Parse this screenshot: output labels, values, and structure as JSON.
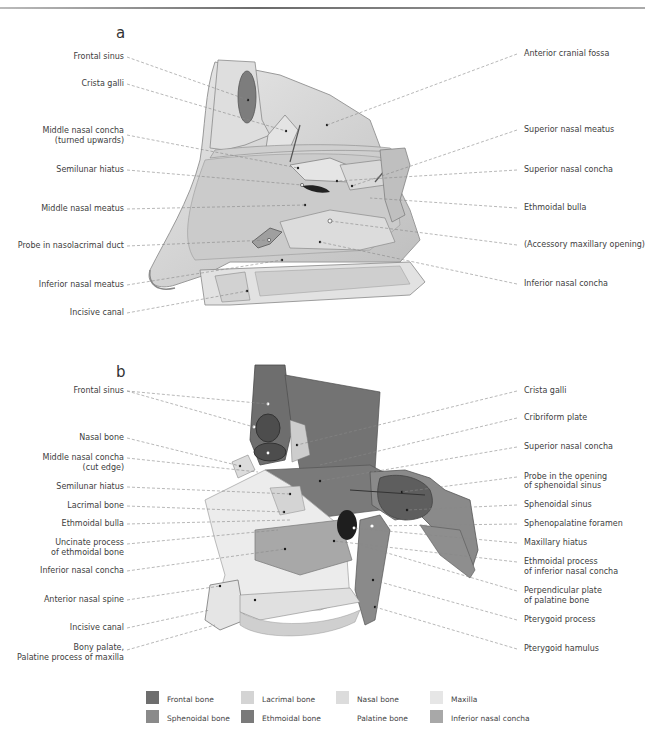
{
  "figure": {
    "panels": [
      {
        "id": "a",
        "letter": "a",
        "left_labels": [
          "Frontal sinus",
          "Crista galli",
          "Middle nasal concha",
          "(turned upwards)",
          "Semilunar hiatus",
          "Middle nasal meatus",
          "Probe in nasolacrimal duct",
          "Inferior nasal meatus",
          "Incisive canal"
        ],
        "right_labels": [
          "Anterior cranial fossa",
          "Superior nasal meatus",
          "Superior nasal concha",
          "Ethmoidal bulla",
          "(Accessory maxillary opening)",
          "Inferior nasal concha"
        ]
      },
      {
        "id": "b",
        "letter": "b",
        "left_labels": [
          "Frontal sinus",
          "Nasal bone",
          "Middle nasal concha",
          "(cut edge)",
          "Semilunar hiatus",
          "Lacrimal bone",
          "Ethmoidal bulla",
          "Uncinate process",
          "of ethmoidal bone",
          "Inferior nasal concha",
          "Anterior nasal spine",
          "Incisive canal",
          "Bony palate,",
          "Palatine process of maxilla"
        ],
        "right_labels": [
          "Crista galli",
          "Cribriform plate",
          "Superior nasal concha",
          "Probe in the opening",
          "of sphenoidal sinus",
          "Sphenoidal sinus",
          "Sphenopalatine foramen",
          "Maxillary hiatus",
          "Ethmoidal process",
          "of inferior nasal concha",
          "Perpendicular plate",
          "of palatine bone",
          "Pterygoid process",
          "Pterygoid hamulus"
        ]
      }
    ]
  },
  "legend": {
    "items": [
      {
        "label": "Frontal bone",
        "color": "#6e6e6e"
      },
      {
        "label": "Lacrimal bone",
        "color": "#d4d4d4"
      },
      {
        "label": "Nasal bone",
        "color": "#dcdcdc"
      },
      {
        "label": "Maxilla",
        "color": "#e6e6e6"
      },
      {
        "label": "Sphenoidal bone",
        "color": "#8a8a8a"
      },
      {
        "label": "Ethmoidal bone",
        "color": "#7a7a7a"
      },
      {
        "label": "Palatine bone",
        "color": "#ffffff"
      },
      {
        "label": "Inferior nasal concha",
        "color": "#a8a8a8"
      }
    ]
  }
}
